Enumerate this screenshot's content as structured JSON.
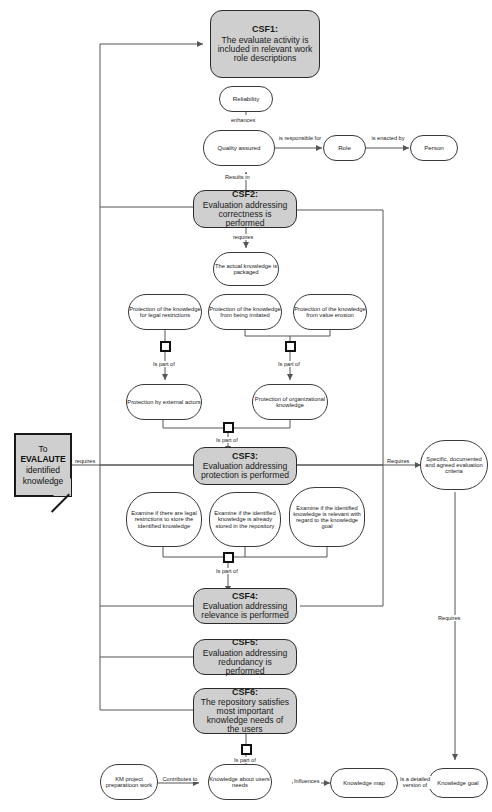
{
  "diagram": {
    "colors": {
      "csf_fill": "#cfcfcf",
      "node_fill": "#ffffff",
      "line": "#555555",
      "stroke": "#2b2b2b"
    },
    "goal_note": {
      "line1": "To",
      "line2": "EVALAUTE",
      "line3": "identified",
      "line4": "knowledge"
    },
    "csf": [
      {
        "id": "CSF1:",
        "text": "The evaluate activity is included in relevant work role descriptions"
      },
      {
        "id": "CSF2:",
        "text": "Evaluation addressing correctness is performed"
      },
      {
        "id": "CSF3:",
        "text": "Evaluation addressing protection is performed"
      },
      {
        "id": "CSF4:",
        "text": "Evaluation addressing relevance is performed"
      },
      {
        "id": "CSF5:",
        "text": "Evaluation addressing redundancy is performed"
      },
      {
        "id": "CSF6:",
        "text": "The repository satisfies most important knowledge needs of the users"
      }
    ],
    "nodes": {
      "reliability": "Reliability",
      "quality_assured": "Quality assured",
      "role": "Role",
      "person": "Person",
      "actual_knowledge": "The actual knowledge is packaged",
      "prot_legal": "Protection of the knowledge for legal restrictions",
      "prot_imitated": "Protection of the knowledge from being imitated",
      "prot_value": "Protection of the knowledge from value erosion",
      "prot_external": "Protection by external actors",
      "prot_org": "Protection of organizational knowledge",
      "examine_legal": "Examine if there are legal restrictions to store the identified knowledge",
      "examine_stored": "Examine if the identified knowledge is already stored in the repository",
      "examine_relevant": "Examine if the identified knowledge is relevant with regard to the knowledge goal",
      "criteria": "Specific, documented and agreed evaluation criteria",
      "km_project": "KM project preparatioon work",
      "knowledge_users": "Knowledge about users' needs",
      "knowledge_map": "Knowledge map",
      "knowledge_goal": "Knowledge goal"
    },
    "edge_labels": {
      "requires_goal": "requires",
      "enhances": "enhances",
      "is_responsible_for": "is responsible for",
      "is_enacted_by": "is enacted by",
      "results_in": "Results in",
      "requires_csf2": "requires",
      "is_part_of_1": "Is part of",
      "is_part_of_2": "Is part of",
      "is_part_of_3": "Is part of",
      "is_part_of_4": "Is part of",
      "is_part_of_5": "Is part of",
      "requires_criteria": "Requires",
      "requires_goal_node": "Requires",
      "contributes_to": "Contributes to",
      "influences": "Influences",
      "is_detailed_version_of": "Is a detailed version of"
    }
  }
}
